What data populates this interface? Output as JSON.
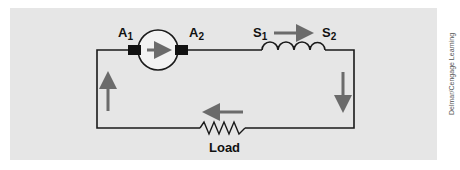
{
  "diagram": {
    "type": "series DC generator circuit",
    "colors": {
      "background": "#e6e6e6",
      "wire": "#1a1a1a",
      "arrow": "#6b6b6b",
      "brush": "#111111"
    },
    "components": {
      "armature": {
        "terminal_left": "A",
        "terminal_left_sub": "1",
        "terminal_right": "A",
        "terminal_right_sub": "2",
        "current_direction": "right"
      },
      "series_field": {
        "terminal_left": "S",
        "terminal_left_sub": "1",
        "terminal_right": "S",
        "terminal_right_sub": "2",
        "current_direction": "right"
      },
      "load": {
        "label": "Load",
        "current_direction": "left"
      }
    },
    "current_arrows": [
      {
        "location": "left-wire",
        "direction": "up"
      },
      {
        "location": "right-wire",
        "direction": "down"
      },
      {
        "location": "armature",
        "direction": "right"
      },
      {
        "location": "series-field",
        "direction": "right"
      },
      {
        "location": "load",
        "direction": "left"
      }
    ]
  },
  "credit": "Delmar/Cengage Learning"
}
